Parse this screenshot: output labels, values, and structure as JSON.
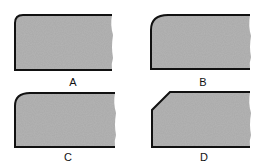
{
  "figure": {
    "panels": [
      {
        "id": "A",
        "label": "A",
        "corner": "small-radius"
      },
      {
        "id": "B",
        "label": "B",
        "corner": "large-radius"
      },
      {
        "id": "C",
        "label": "C",
        "corner": "medium-radius"
      },
      {
        "id": "D",
        "label": "D",
        "corner": "chamfer"
      }
    ],
    "colors": {
      "fill": "#a9a9a9",
      "outline": "#111111",
      "background": "#ffffff"
    }
  }
}
